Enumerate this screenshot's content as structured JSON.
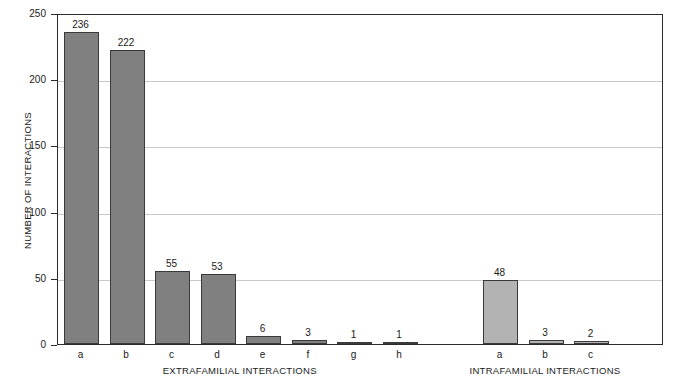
{
  "chart_data": {
    "type": "bar",
    "title": "",
    "xlabel": "",
    "ylabel": "NUMBER OF INTERACTIONS",
    "ylim": [
      0,
      250
    ],
    "yticks": [
      0,
      50,
      100,
      150,
      200,
      250
    ],
    "ytick_labels": [
      "0",
      "50",
      "100",
      "150",
      "200",
      "250"
    ],
    "grid": "horizontal",
    "legend": "none",
    "groups": [
      {
        "name": "EXTRAFAMILIAL INTERACTIONS",
        "color": "#808080",
        "categories": [
          "a",
          "b",
          "c",
          "d",
          "e",
          "f",
          "g",
          "h"
        ],
        "values": [
          236,
          222,
          55,
          53,
          6,
          3,
          1,
          1
        ],
        "value_labels": [
          "236",
          "222",
          "55",
          "53",
          "6",
          "3",
          "1",
          "1"
        ]
      },
      {
        "name": "INTRAFAMILIAL INTERACTIONS",
        "color": "#b3b3b3",
        "categories": [
          "a",
          "b",
          "c"
        ],
        "values": [
          48,
          3,
          2
        ],
        "value_labels": [
          "48",
          "3",
          "2"
        ]
      }
    ]
  },
  "axis": {
    "y_title": "NUMBER OF INTERACTIONS",
    "group_titles": {
      "extrafamilial": "EXTRAFAMILIAL INTERACTIONS",
      "intrafamilial": "INTRAFAMILIAL INTERACTIONS"
    }
  },
  "colors": {
    "extrafamilial_bar": "#808080",
    "intrafamilial_bar": "#b3b3b3",
    "bar_border": "#3a3a3a",
    "gridline": "#c9c9c9",
    "frame": "#2b2b2b",
    "background": "#ffffff",
    "text": "#1a1a1a"
  }
}
